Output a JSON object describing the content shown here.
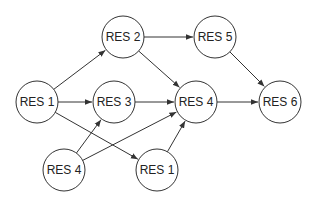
{
  "diagram": {
    "type": "directed-graph",
    "node_radius": 21,
    "colors": {
      "stroke": "#333333",
      "fill": "#ffffff",
      "text": "#222222",
      "background": "#ffffff"
    },
    "nodes": [
      {
        "id": "n_res1_left",
        "label": "RES 1",
        "x": 37,
        "y": 102
      },
      {
        "id": "n_res2",
        "label": "RES 2",
        "x": 123,
        "y": 37
      },
      {
        "id": "n_res3",
        "label": "RES 3",
        "x": 114,
        "y": 102
      },
      {
        "id": "n_res4_center",
        "label": "RES 4",
        "x": 196,
        "y": 102
      },
      {
        "id": "n_res5",
        "label": "RES 5",
        "x": 215,
        "y": 37
      },
      {
        "id": "n_res6",
        "label": "RES 6",
        "x": 280,
        "y": 102
      },
      {
        "id": "n_res4_bottom",
        "label": "RES 4",
        "x": 64,
        "y": 170
      },
      {
        "id": "n_res1_bottom",
        "label": "RES 1",
        "x": 157,
        "y": 170
      }
    ],
    "edges": [
      {
        "from": "n_res1_left",
        "to": "n_res2"
      },
      {
        "from": "n_res1_left",
        "to": "n_res3"
      },
      {
        "from": "n_res1_left",
        "to": "n_res1_bottom"
      },
      {
        "from": "n_res2",
        "to": "n_res5"
      },
      {
        "from": "n_res2",
        "to": "n_res4_center"
      },
      {
        "from": "n_res3",
        "to": "n_res4_center"
      },
      {
        "from": "n_res5",
        "to": "n_res6"
      },
      {
        "from": "n_res4_center",
        "to": "n_res6"
      },
      {
        "from": "n_res4_bottom",
        "to": "n_res3"
      },
      {
        "from": "n_res4_bottom",
        "to": "n_res4_center"
      },
      {
        "from": "n_res1_bottom",
        "to": "n_res4_center"
      }
    ]
  }
}
